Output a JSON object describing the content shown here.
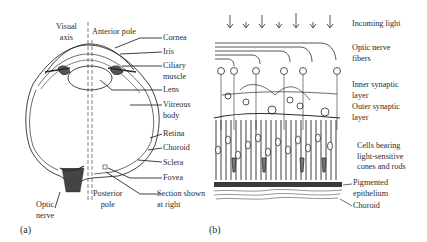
{
  "panel_a": {
    "panel_label": "(a)",
    "labels": {
      "visual_axis_1": "Visual",
      "visual_axis_2": "axis",
      "anterior_pole": "Anterior pole",
      "cornea": "Cornea",
      "iris": "Iris",
      "ciliary_1": "Ciliary",
      "ciliary_2": "muscle",
      "lens": "Lens",
      "vitreous_1": "Vitreous",
      "vitreous_2": "body",
      "retina": "Retina",
      "choroid": "Choroid",
      "sclera": "Sclera",
      "fovea": "Fovea",
      "section_1": "Section shown",
      "section_2": "at right",
      "posterior_1": "Posterior",
      "posterior_2": "pole",
      "optic_1": "Optic",
      "optic_2": "nerve"
    }
  },
  "panel_b": {
    "panel_label": "(b)",
    "labels": {
      "incoming_light": "Incoming light",
      "optic_fibers_1": "Optic nerve",
      "optic_fibers_2": "fibers",
      "inner_syn_1": "Inner synaptic",
      "inner_syn_2": "layer",
      "outer_syn_1": "Outer synaptic",
      "outer_syn_2": "layer",
      "cells_1": "Cells bearing",
      "cells_2": "light-sensitive",
      "cells_3": "cones and rods",
      "pigmented_1": "Pigmented",
      "pigmented_2": "epithelium",
      "choroid": "Choroid"
    }
  },
  "colors": {
    "ink": "#2b2b2b",
    "background": "#ffffff"
  }
}
